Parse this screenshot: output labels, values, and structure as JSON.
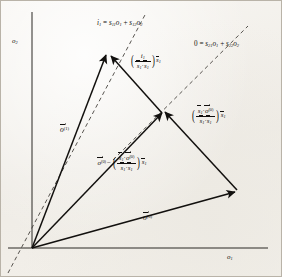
{
  "figure": {
    "background_color": "#f4f2ee",
    "ink_color": "#12100e",
    "axes": {
      "x_label": "o",
      "x_label_sub": "1",
      "y_label": "o",
      "y_label_sub": "2"
    },
    "annotations": {
      "line1": {
        "lhs": "i",
        "lhs_sub": "1",
        "eq": "=",
        "term1_coef": "s",
        "term1_coef_sub": "11",
        "term1_var": "o",
        "term1_var_sub": "1",
        "plus": "+",
        "term2_coef": "s",
        "term2_coef_sub": "12",
        "term2_var": "o",
        "term2_var_sub": "2"
      },
      "line2": {
        "lhs": "0",
        "eq": "=",
        "term1_coef": "s",
        "term1_coef_sub": "21",
        "term1_var": "o",
        "term1_var_sub": "1",
        "plus": "+",
        "term2_coef": "s",
        "term2_coef_sub": "22",
        "term2_var": "o",
        "term2_var_sub": "2"
      }
    },
    "vectors": {
      "o1": {
        "symbol": "o",
        "superscript": "(1)"
      },
      "o0": {
        "symbol": "o",
        "superscript": "(0)"
      }
    },
    "expressions": {
      "top_right": {
        "num_symbol": "i",
        "num_sub": "1",
        "den_left": "s",
        "den_left_sub": "1",
        "dot": "·",
        "den_right": "s",
        "den_right_sub": "1",
        "tail": "s",
        "tail_sub": "1"
      },
      "right_side": {
        "num_left": "s",
        "num_left_sub": "1",
        "dot": "·",
        "num_right": "o",
        "num_right_sup": "(0)",
        "den_left": "s",
        "den_left_sub": "1",
        "den_right": "s",
        "den_right_sub": "1",
        "tail": "s",
        "tail_sub": "1"
      },
      "middle": {
        "lead": "o",
        "lead_sup": "(0)",
        "minus": "−",
        "num_left": "s",
        "num_left_sub": "1",
        "dot": "·",
        "num_right": "o",
        "num_right_sup": "(0)",
        "den_left": "s",
        "den_left_sub": "1",
        "den_right": "s",
        "den_right_sub": "1",
        "tail": "s",
        "tail_sub": "1"
      }
    }
  }
}
